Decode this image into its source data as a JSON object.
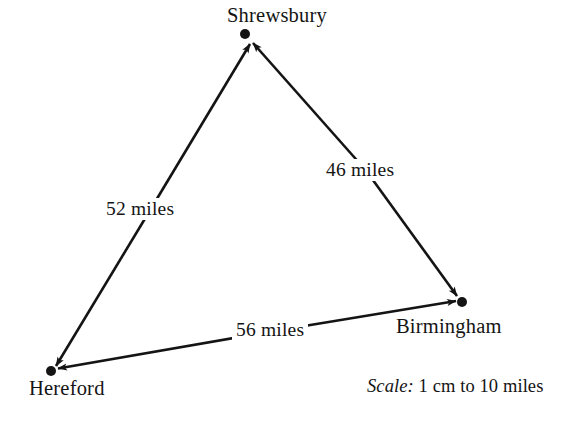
{
  "diagram": {
    "type": "triangle-distance-map",
    "background_color": "#ffffff",
    "ink_color": "#141414",
    "nodes": [
      {
        "id": "shrewsbury",
        "label": "Shrewsbury",
        "x": 245,
        "y": 34,
        "label_position": "above"
      },
      {
        "id": "hereford",
        "label": "Hereford",
        "x": 51,
        "y": 371,
        "label_position": "below"
      },
      {
        "id": "birmingham",
        "label": "Birmingham",
        "x": 462,
        "y": 302,
        "label_position": "below"
      }
    ],
    "edges": [
      {
        "id": "shrewsbury-hereford",
        "from": "shrewsbury",
        "to": "hereford",
        "label": "52 miles",
        "arrowheads": "both",
        "label_x": 150,
        "label_y": 210
      },
      {
        "id": "shrewsbury-birmingham",
        "from": "shrewsbury",
        "to": "birmingham",
        "label": "46 miles",
        "arrowheads": "both",
        "label_x": 366,
        "label_y": 171
      },
      {
        "id": "birmingham-hereford",
        "from": "birmingham",
        "to": "hereford",
        "label": "56 miles",
        "arrowheads": "both",
        "label_x": 277,
        "label_y": 331
      }
    ]
  },
  "scale": {
    "keyword": "Scale:",
    "value": "1 cm to 10 miles",
    "full_text": "Scale: 1 cm to 10 miles"
  }
}
